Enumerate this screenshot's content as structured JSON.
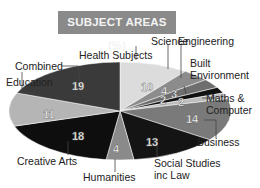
{
  "chart_data": {
    "type": "pie",
    "title": "SUBJECT AREAS (%)",
    "categories": [
      "Health Subjects",
      "Science",
      "Engineering",
      "Built Environment",
      "Maths & Computer",
      "Business",
      "Social Studies inc Law",
      "Humanities",
      "Creative Arts",
      "Education",
      "Combined"
    ],
    "values": [
      10,
      4,
      3,
      2,
      2,
      14,
      13,
      4,
      18,
      11,
      19
    ],
    "colors": [
      "#dcdcdc",
      "#8c8c8c",
      "#6e6e6e",
      "#111111",
      "#bdbdbd",
      "#7a7a7a",
      "#141414",
      "#8a8a8a",
      "#0e0e0e",
      "#b5b5b5",
      "#3a3a3a"
    ],
    "unit": "%",
    "legend": "callout labels"
  },
  "title": "SUBJECT AREAS (%)",
  "labels": {
    "health": "Health Subjects",
    "science": "Science",
    "engineering": "Engineering",
    "built1": "Built",
    "built2": "Environment",
    "maths1": "Maths &",
    "maths2": "Computer",
    "business": "Business",
    "social1": "Social Studies",
    "social2": "inc Law",
    "humanities": "Humanities",
    "creative": "Creative Arts",
    "education": "Education",
    "combined": "Combined"
  },
  "values": {
    "health": "10",
    "science": "4",
    "engineering": "3",
    "built": "2",
    "maths": "2",
    "business": "14",
    "social": "13",
    "humanities": "4",
    "creative": "18",
    "education": "11",
    "combined": "19"
  }
}
